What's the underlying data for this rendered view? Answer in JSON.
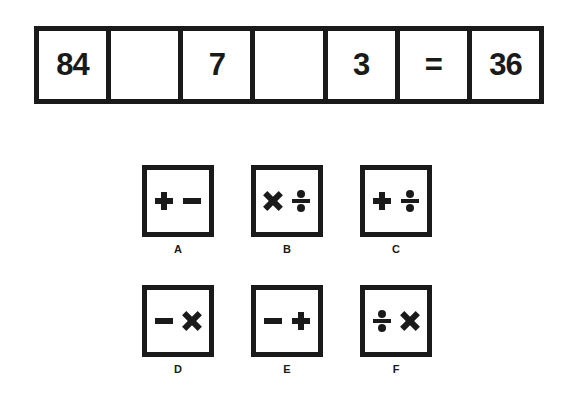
{
  "equation": {
    "cells": [
      "84",
      "",
      "7",
      "",
      "3",
      "=",
      "36"
    ]
  },
  "options": [
    {
      "label": "A",
      "symbols": [
        "plus",
        "minus"
      ]
    },
    {
      "label": "B",
      "symbols": [
        "times",
        "div"
      ]
    },
    {
      "label": "C",
      "symbols": [
        "plus",
        "div"
      ]
    },
    {
      "label": "D",
      "symbols": [
        "minus",
        "times"
      ]
    },
    {
      "label": "E",
      "symbols": [
        "minus",
        "plus"
      ]
    },
    {
      "label": "F",
      "symbols": [
        "div",
        "times"
      ]
    }
  ]
}
